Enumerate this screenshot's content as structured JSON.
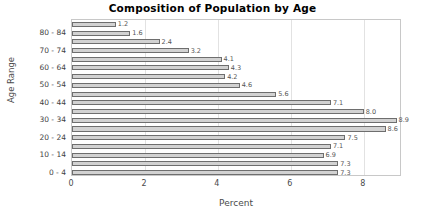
{
  "chart_data": {
    "type": "bar",
    "orientation": "horizontal",
    "title": "Composition of Population by Age",
    "xlabel": "Percent",
    "ylabel": "Age Range",
    "categories": [
      "0 - 4",
      "5 - 9",
      "10 - 14",
      "15 - 19",
      "20 - 24",
      "25 - 29",
      "30 - 34",
      "35 - 39",
      "40 - 44",
      "45 - 49",
      "50 - 54",
      "55 - 59",
      "60 - 64",
      "65 - 69",
      "70 - 74",
      "75 - 79",
      "80 - 84",
      "85 +"
    ],
    "values": [
      7.3,
      7.3,
      6.9,
      7.1,
      7.5,
      8.6,
      8.9,
      8.0,
      7.1,
      5.6,
      4.6,
      4.2,
      4.3,
      4.1,
      3.2,
      2.4,
      1.6,
      1.2
    ],
    "value_labels": [
      "7.3",
      "7.3",
      "6.9",
      "7.1",
      "7.5",
      "8.6",
      "8.9",
      "8.0",
      "7.1",
      "5.6",
      "4.6",
      "4.2",
      "4.3",
      "4.1",
      "3.2",
      "2.4",
      "1.6",
      "1.2"
    ],
    "ytick_labels": [
      "0 - 4",
      "10 - 14",
      "20 - 24",
      "30 - 34",
      "40 - 44",
      "50 - 54",
      "60 - 64",
      "70 - 74",
      "80 - 84"
    ],
    "ytick_categories": [
      "0 - 4",
      "10 - 14",
      "20 - 24",
      "30 - 34",
      "40 - 44",
      "50 - 54",
      "60 - 64",
      "70 - 74",
      "80 - 84"
    ],
    "xtick_labels": [
      "0",
      "2",
      "4",
      "6",
      "8"
    ],
    "xticks": [
      0,
      2,
      4,
      6,
      8
    ],
    "xlim": [
      0,
      9.05
    ],
    "ylim_count": 18,
    "grid": "vertical",
    "legend": "none",
    "bar_fill_color": "#d2d2d2",
    "bar_edge_color": "#6e6e6e",
    "plot_border_color": "#c8c8c8",
    "gridline_color": "#e2e2e2",
    "title_color": "#000000",
    "label_color": "#4a4a4a"
  }
}
